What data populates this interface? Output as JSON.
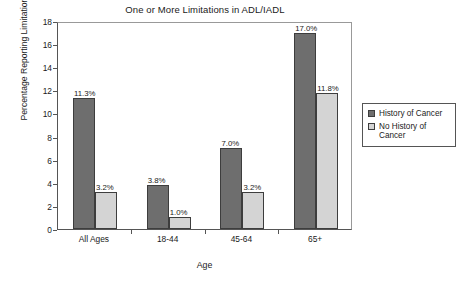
{
  "chart_data": {
    "type": "bar",
    "title": "One or More Limitations in ADL/IADL",
    "xlabel": "Age",
    "ylabel": "Percentage Reporting Limitation(s)",
    "categories": [
      "All Ages",
      "18-44",
      "45-64",
      "65+"
    ],
    "ylim": [
      0,
      18
    ],
    "yticks": [
      0,
      2,
      4,
      6,
      8,
      10,
      12,
      14,
      16,
      18
    ],
    "ytick_labels": [
      "0",
      "2",
      "4",
      "6",
      "8",
      "10",
      "12",
      "14",
      "16",
      "18"
    ],
    "grid": false,
    "legend_position": "right",
    "series": [
      {
        "name": "History of Cancer",
        "color": "#6e6e6e",
        "values": [
          11.3,
          3.8,
          7.0,
          17.0
        ],
        "data_labels": [
          "11.3%",
          "3.8%",
          "7.0%",
          "17.0%"
        ]
      },
      {
        "name": "No History of Cancer",
        "color": "#d4d4d4",
        "values": [
          3.2,
          1.0,
          3.2,
          11.8
        ],
        "data_labels": [
          "3.2%",
          "1.0%",
          "3.2%",
          "11.8%"
        ]
      }
    ]
  },
  "legend": {
    "items": [
      {
        "label": "History of Cancer",
        "color": "#6e6e6e"
      },
      {
        "label": "No History of Cancer",
        "color": "#d4d4d4"
      }
    ]
  }
}
